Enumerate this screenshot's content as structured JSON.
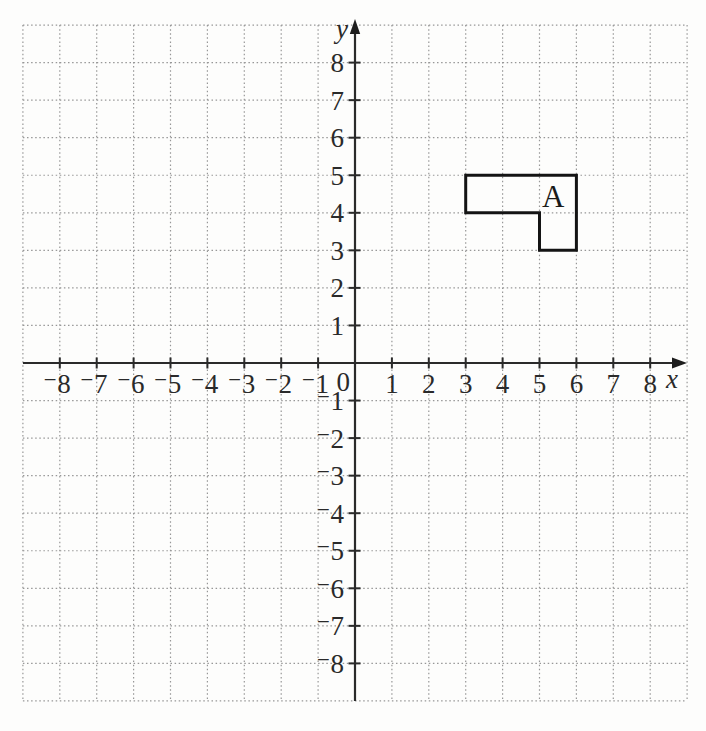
{
  "figure": {
    "background_color": "#fdfdfc",
    "grid_color": "#979797",
    "axis_color": "#2a2a2a",
    "label_color": "#2a2a2a",
    "shape_outline_color": "#141414",
    "axes": {
      "x_label": "x",
      "y_label": "y",
      "origin_label": "0"
    }
  },
  "chart_data": {
    "type": "coordinate-grid",
    "title": "",
    "grid": {
      "style": "dotted",
      "spacing": 1,
      "on": true
    },
    "x_axis": {
      "label": "x",
      "min": -9,
      "max": 9,
      "tick_values": [
        -8,
        -7,
        -6,
        -5,
        -4,
        -3,
        -2,
        -1,
        1,
        2,
        3,
        4,
        5,
        6,
        7,
        8
      ],
      "tick_labels": [
        "⁻8",
        "⁻7",
        "⁻6",
        "⁻5",
        "⁻4",
        "⁻3",
        "⁻2",
        "⁻1",
        "1",
        "2",
        "3",
        "4",
        "5",
        "6",
        "7",
        "8"
      ]
    },
    "y_axis": {
      "label": "y",
      "min": -9,
      "max": 9,
      "tick_values": [
        -8,
        -7,
        -6,
        -5,
        -4,
        -3,
        -2,
        -1,
        1,
        2,
        3,
        4,
        5,
        6,
        7,
        8
      ],
      "tick_labels": [
        "⁻8",
        "⁻7",
        "⁻6",
        "⁻5",
        "⁻4",
        "⁻3",
        "⁻2",
        "⁻1",
        "1",
        "2",
        "3",
        "4",
        "5",
        "6",
        "7",
        "8"
      ]
    },
    "shapes": [
      {
        "label": "A",
        "label_position": [
          5.37,
          4.45
        ],
        "vertices": [
          [
            3,
            5
          ],
          [
            6,
            5
          ],
          [
            6,
            3
          ],
          [
            5,
            3
          ],
          [
            5,
            4
          ],
          [
            3,
            4
          ]
        ],
        "fill": "none"
      }
    ]
  }
}
